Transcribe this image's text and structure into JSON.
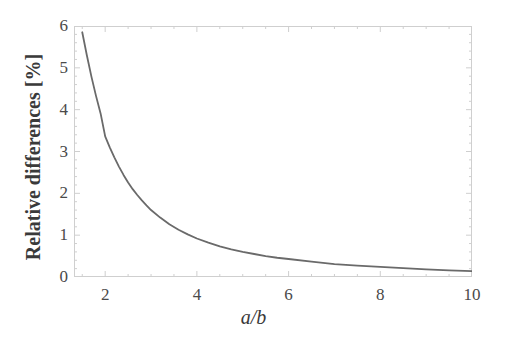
{
  "chart_data": {
    "type": "line",
    "title": "",
    "subtitle": "",
    "xlabel": "a/b",
    "ylabel": "Relative differences [%]",
    "xlim": [
      1.32,
      10.0
    ],
    "ylim": [
      0,
      6.0
    ],
    "xticks": [
      2,
      4,
      6,
      8,
      10
    ],
    "yticks": [
      0,
      1,
      2,
      3,
      4,
      5,
      6
    ],
    "xtick_labels": [
      "2",
      "4",
      "6",
      "8",
      "10"
    ],
    "ytick_labels": [
      "0",
      "1",
      "2",
      "3",
      "4",
      "5",
      "6"
    ],
    "grid": false,
    "legend": null,
    "legend_position": "none",
    "frame": true,
    "minor_ticks": true,
    "series": [
      {
        "name": "Relative difference",
        "color": "#6a6a6a",
        "linewidth": 1.8,
        "x": [
          1.5,
          1.6,
          1.7,
          1.8,
          1.9,
          2.0,
          2.1,
          2.2,
          2.3,
          2.4,
          2.5,
          2.6,
          2.7,
          2.8,
          2.9,
          3.0,
          3.2,
          3.4,
          3.6,
          3.8,
          4.0,
          4.25,
          4.5,
          4.75,
          5.0,
          5.25,
          5.5,
          5.75,
          6.0,
          6.5,
          7.0,
          7.5,
          8.0,
          8.5,
          9.0,
          9.5,
          10.0
        ],
        "y": [
          5.85,
          5.3,
          4.79,
          4.33,
          3.91,
          3.36,
          3.1,
          2.86,
          2.64,
          2.44,
          2.26,
          2.1,
          1.96,
          1.83,
          1.71,
          1.6,
          1.42,
          1.26,
          1.13,
          1.02,
          0.92,
          0.82,
          0.73,
          0.66,
          0.6,
          0.55,
          0.5,
          0.46,
          0.43,
          0.37,
          0.31,
          0.27,
          0.24,
          0.21,
          0.18,
          0.16,
          0.14
        ]
      }
    ]
  },
  "axes": {
    "x_title": "a/b",
    "y_title": "Relative differences [%]"
  },
  "colors": {
    "curve": "#6a6a6a",
    "frame": "#cfcfcf",
    "tick_text": "#4a4a4a",
    "label_text": "#3a3a3a",
    "background": "#ffffff"
  }
}
